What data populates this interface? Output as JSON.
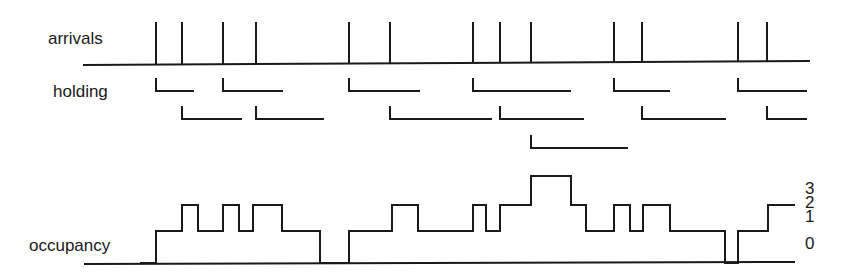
{
  "labels": {
    "arrivals": "arrivals",
    "holding": "holding",
    "occupancy": "occupancy"
  },
  "occupancy_axis_ticks": [
    "3",
    "2",
    "1",
    "0"
  ],
  "colors": {
    "ink": "#1a1a1a",
    "background": "#ffffff"
  },
  "chart_data": {
    "type": "diagram",
    "title": "",
    "arrivals": [
      156,
      182,
      223,
      256,
      349,
      390,
      473,
      500,
      531,
      614,
      642,
      738,
      767
    ],
    "holding": [
      {
        "row": 0,
        "start": 156,
        "end": 194
      },
      {
        "row": 1,
        "start": 182,
        "end": 242
      },
      {
        "row": 0,
        "start": 223,
        "end": 283
      },
      {
        "row": 1,
        "start": 256,
        "end": 324
      },
      {
        "row": 0,
        "start": 349,
        "end": 420
      },
      {
        "row": 1,
        "start": 390,
        "end": 492
      },
      {
        "row": 0,
        "start": 473,
        "end": 571
      },
      {
        "row": 1,
        "start": 500,
        "end": 584
      },
      {
        "row": 2,
        "start": 531,
        "end": 628
      },
      {
        "row": 0,
        "start": 614,
        "end": 670
      },
      {
        "row": 1,
        "start": 642,
        "end": 726
      },
      {
        "row": 0,
        "start": 738,
        "end": 807
      },
      {
        "row": 1,
        "start": 767,
        "end": 807
      }
    ],
    "occupancy_steps": [
      [
        140,
        0
      ],
      [
        156,
        1
      ],
      [
        182,
        2
      ],
      [
        198,
        1
      ],
      [
        223,
        2
      ],
      [
        239,
        1
      ],
      [
        253,
        2
      ],
      [
        282,
        1
      ],
      [
        320,
        0
      ],
      [
        349,
        1
      ],
      [
        392,
        2
      ],
      [
        418,
        1
      ],
      [
        473,
        2
      ],
      [
        486,
        1
      ],
      [
        500,
        2
      ],
      [
        531,
        3
      ],
      [
        571,
        2
      ],
      [
        586,
        1
      ],
      [
        614,
        2
      ],
      [
        630,
        1
      ],
      [
        643,
        2
      ],
      [
        670,
        1
      ],
      [
        725,
        0
      ],
      [
        738,
        1
      ],
      [
        768,
        2
      ],
      [
        795,
        2
      ]
    ],
    "ylim": [
      0,
      3
    ],
    "yticks": [
      0,
      1,
      2,
      3
    ]
  }
}
